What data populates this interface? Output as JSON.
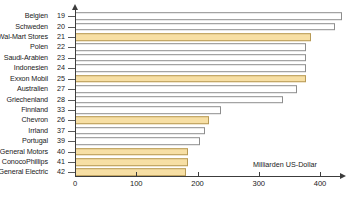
{
  "chart_data": {
    "type": "bar",
    "orientation": "horizontal",
    "title": "",
    "xlabel": "Milliarden US-Dollar",
    "ylabel": "",
    "xlim": [
      0,
      440
    ],
    "grid": false,
    "legend": null,
    "xticks": [
      0,
      100,
      200,
      300,
      400
    ],
    "xtick_labels": [
      "0",
      "100",
      "200",
      "300",
      "400"
    ],
    "categories": [
      "Belgien",
      "Schweden",
      "Wal-Mart Stores",
      "Polen",
      "Saudi-Arabien",
      "Indonesien",
      "Exxon Mobil",
      "Australien",
      "Griechenland",
      "Finnland",
      "Chevron",
      "Irrland",
      "Portugal",
      "General Motors",
      "ConocoPhillips",
      "General Electric"
    ],
    "ranks": [
      19,
      20,
      21,
      22,
      23,
      24,
      25,
      27,
      28,
      33,
      26,
      37,
      39,
      40,
      41,
      42
    ],
    "values": [
      436,
      424,
      385,
      377,
      377,
      377,
      377,
      363,
      340,
      239,
      218,
      213,
      204,
      185,
      184,
      182
    ],
    "highlight_flags": [
      false,
      false,
      true,
      false,
      false,
      false,
      true,
      false,
      false,
      false,
      true,
      false,
      false,
      true,
      true,
      true
    ],
    "colors": {
      "bar_company": "#f7dfa4",
      "bar_company_border": "#b79a57",
      "bar_country": "#ffffff",
      "bar_country_border": "#8d8d8d",
      "axis": "#3c3c3c",
      "text": "#1a1a1a"
    }
  }
}
